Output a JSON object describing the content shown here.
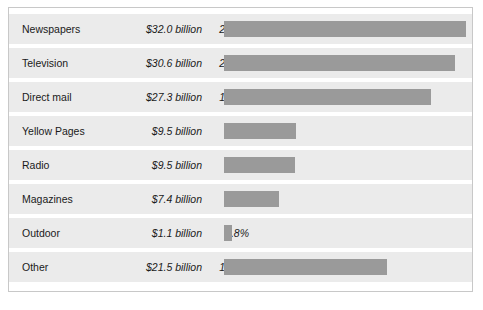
{
  "chart_data": {
    "type": "bar",
    "title": "",
    "subtitle": "",
    "xlabel": "",
    "ylabel": "",
    "orientation": "horizontal",
    "grid": false,
    "legend": false,
    "axis_visible": false,
    "value_unit": "billion USD",
    "columns": [
      "Medium",
      "Spending",
      "Share"
    ],
    "categories": [
      "Newspapers",
      "Television",
      "Direct mail",
      "Yellow Pages",
      "Radio",
      "Magazines",
      "Outdoor",
      "Other"
    ],
    "values": [
      32.0,
      30.6,
      27.3,
      9.5,
      9.5,
      7.4,
      1.1,
      21.5
    ],
    "percents": [
      23.2,
      22.1,
      19.8,
      6.9,
      6.8,
      5.3,
      0.8,
      15.6
    ],
    "xlim": [
      0,
      23.2
    ],
    "bar_color": "#9a9a9a",
    "row_band_color": "#ebebeb",
    "border_color": "#c8c8c8",
    "rows": [
      {
        "label": "Newspapers",
        "value_text": "$32.0 billion",
        "pct_text": "23.2%",
        "pct": 23.2
      },
      {
        "label": "Television",
        "value_text": "$30.6 billion",
        "pct_text": "22.1%",
        "pct": 22.1
      },
      {
        "label": "Direct mail",
        "value_text": "$27.3 billion",
        "pct_text": "19.8%",
        "pct": 19.8
      },
      {
        "label": "Yellow Pages",
        "value_text": "$9.5 billion",
        "pct_text": "6.9%",
        "pct": 6.9
      },
      {
        "label": "Radio",
        "value_text": "$9.5 billion",
        "pct_text": "6.8%",
        "pct": 6.8
      },
      {
        "label": "Magazines",
        "value_text": "$7.4 billion",
        "pct_text": "5.3%",
        "pct": 5.3
      },
      {
        "label": "Outdoor",
        "value_text": "$1.1 billion",
        "pct_text": "0.8%",
        "pct": 0.8
      },
      {
        "label": "Other",
        "value_text": "$21.5 billion",
        "pct_text": "15.6%",
        "pct": 15.6
      }
    ]
  }
}
